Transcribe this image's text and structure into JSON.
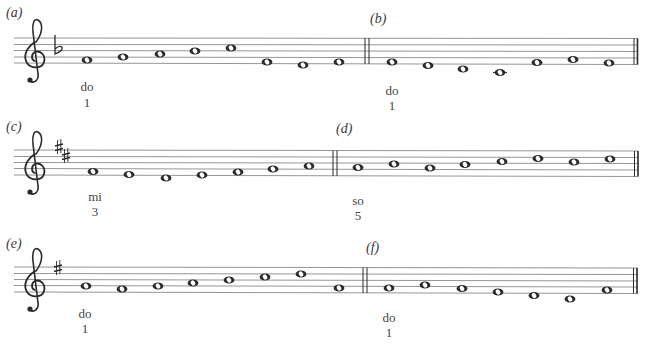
{
  "colors": {
    "ink": "#2a2a2a",
    "staff_line": "#8a8a8a",
    "background": "#ffffff"
  },
  "systems": [
    {
      "id": "system-1",
      "clef": "treble",
      "key_signature": {
        "type": "flat",
        "count": 1,
        "name": "F major"
      },
      "staff_top": 38,
      "line_spacing": 6.2,
      "examples": [
        {
          "label": "(a)",
          "notes": [
            "F4",
            "G4",
            "A4",
            "Bb4",
            "C5",
            "E4",
            "D4",
            "F4"
          ],
          "start_annotation": {
            "syllable": "do",
            "degree": "1"
          }
        },
        {
          "label": "(b)",
          "notes": [
            "F4",
            "E4",
            "D4",
            "C4",
            "G4",
            "A4",
            "F4"
          ],
          "start_annotation": {
            "syllable": "do",
            "degree": "1"
          }
        }
      ]
    },
    {
      "id": "system-2",
      "clef": "treble",
      "key_signature": {
        "type": "sharp",
        "count": 2,
        "name": "D major"
      },
      "staff_top": 150,
      "line_spacing": 6.2,
      "examples": [
        {
          "label": "(c)",
          "notes": [
            "F#4",
            "E4",
            "D4",
            "E4",
            "F#4",
            "G4",
            "A4"
          ],
          "start_annotation": {
            "syllable": "mi",
            "degree": "3"
          }
        },
        {
          "label": "(d)",
          "notes": [
            "A4",
            "B4",
            "A4",
            "B4",
            "C#5",
            "D5",
            "C#5",
            "D5"
          ],
          "start_annotation": {
            "syllable": "so",
            "degree": "5"
          }
        }
      ]
    },
    {
      "id": "system-3",
      "clef": "treble",
      "key_signature": {
        "type": "sharp",
        "count": 1,
        "name": "G major"
      },
      "staff_top": 267,
      "line_spacing": 6.2,
      "examples": [
        {
          "label": "(e)",
          "notes": [
            "G4",
            "F#4",
            "G4",
            "A4",
            "B4",
            "C5",
            "D5",
            "G4"
          ],
          "start_annotation": {
            "syllable": "do",
            "degree": "1"
          }
        },
        {
          "label": "(f)",
          "notes": [
            "G4",
            "A4",
            "G4",
            "F#4",
            "E4",
            "D4",
            "G4"
          ],
          "start_annotation": {
            "syllable": "do",
            "degree": "1"
          }
        }
      ]
    }
  ],
  "labels": {
    "a": "(a)",
    "b": "(b)",
    "c": "(c)",
    "d": "(d)",
    "e": "(e)",
    "f": "(f)"
  },
  "annotations": {
    "a": {
      "syllable": "do",
      "degree": "1"
    },
    "b": {
      "syllable": "do",
      "degree": "1"
    },
    "c": {
      "syllable": "mi",
      "degree": "3"
    },
    "d": {
      "syllable": "so",
      "degree": "5"
    },
    "e": {
      "syllable": "do",
      "degree": "1"
    },
    "f": {
      "syllable": "do",
      "degree": "1"
    }
  },
  "layout": {
    "systems": [
      {
        "staff_lines_y": [
          38,
          44.5,
          50.5,
          57,
          63
        ],
        "staff_x": [
          14,
          638
        ],
        "clef_x": 16,
        "double_bar_x": 367,
        "final_bar_x": 636,
        "key_sig": [
          {
            "glyph": "flat",
            "x": 56,
            "y": 45
          }
        ],
        "notes_a": [
          [
            87,
            60
          ],
          [
            123,
            57
          ],
          [
            160,
            54
          ],
          [
            195,
            51
          ],
          [
            231,
            48
          ],
          [
            267,
            62
          ],
          [
            303,
            65
          ],
          [
            339,
            62
          ]
        ],
        "notes_b": [
          [
            392,
            62
          ],
          [
            428,
            66
          ],
          [
            463,
            69.5
          ],
          [
            500,
            72.5
          ],
          [
            537,
            63
          ],
          [
            573,
            60
          ],
          [
            609,
            63
          ]
        ]
      },
      {
        "staff_lines_y": [
          150,
          156.5,
          162.5,
          168.5,
          175
        ],
        "staff_x": [
          14,
          638
        ],
        "clef_x": 16,
        "double_bar_x": 335,
        "final_bar_x": 637,
        "key_sig": [
          {
            "glyph": "sharp",
            "x": 58,
            "y": 147
          },
          {
            "glyph": "sharp",
            "x": 65,
            "y": 157
          }
        ],
        "notes_c": [
          [
            93,
            171
          ],
          [
            129,
            175
          ],
          [
            166,
            178
          ],
          [
            202,
            175
          ],
          [
            238,
            172
          ],
          [
            273,
            169
          ],
          [
            309,
            166.5
          ]
        ],
        "notes_d": [
          [
            358,
            167.5
          ],
          [
            394,
            164
          ],
          [
            430,
            168
          ],
          [
            465,
            164.5
          ],
          [
            502,
            161.5
          ],
          [
            538,
            158
          ],
          [
            574,
            161.5
          ],
          [
            610,
            158.5
          ]
        ]
      },
      {
        "staff_lines_y": [
          267,
          273.5,
          279.5,
          285.5,
          292
        ],
        "staff_x": [
          14,
          638
        ],
        "clef_x": 16,
        "double_bar_x": 365,
        "final_bar_x": 636,
        "key_sig": [
          {
            "glyph": "sharp",
            "x": 57,
            "y": 268
          }
        ],
        "notes_e": [
          [
            86,
            286
          ],
          [
            122,
            289
          ],
          [
            158,
            286
          ],
          [
            193,
            283
          ],
          [
            229,
            280
          ],
          [
            265,
            277
          ],
          [
            301,
            274
          ],
          [
            339,
            288
          ]
        ],
        "notes_f": [
          [
            389,
            288
          ],
          [
            425,
            285
          ],
          [
            462,
            289
          ],
          [
            498,
            292.5
          ],
          [
            534,
            296
          ],
          [
            570,
            299
          ],
          [
            607,
            290
          ]
        ]
      }
    ]
  }
}
